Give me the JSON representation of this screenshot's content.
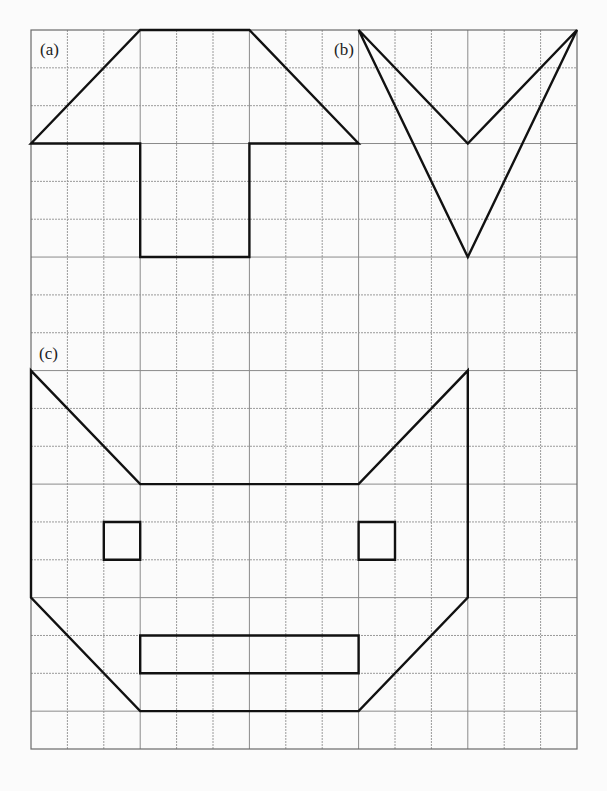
{
  "figure": {
    "grid": {
      "columns": 15,
      "rows": 19
    },
    "labels": [
      {
        "id": "a",
        "text": "(a)"
      },
      {
        "id": "b",
        "text": "(b)"
      },
      {
        "id": "c",
        "text": "(c)"
      }
    ],
    "shapes": [
      {
        "name": "figure-a-outline",
        "label": "a",
        "type": "polygon",
        "points_grid": [
          [
            0,
            3
          ],
          [
            3,
            0
          ],
          [
            6,
            0
          ],
          [
            9,
            3
          ],
          [
            6,
            3
          ],
          [
            6,
            6
          ],
          [
            3,
            6
          ],
          [
            3,
            3
          ]
        ]
      },
      {
        "name": "figure-b-outline",
        "label": "b",
        "type": "polygon",
        "points_grid": [
          [
            9,
            0
          ],
          [
            12,
            3
          ],
          [
            15,
            0
          ],
          [
            12,
            6
          ]
        ]
      },
      {
        "name": "figure-c-outline",
        "label": "c",
        "type": "polygon",
        "points_grid": [
          [
            0,
            9
          ],
          [
            3,
            12
          ],
          [
            9,
            12
          ],
          [
            12,
            9
          ],
          [
            12,
            15
          ],
          [
            9,
            18
          ],
          [
            3,
            18
          ],
          [
            0,
            15
          ]
        ]
      },
      {
        "name": "figure-c-left-eye",
        "label": "c",
        "type": "polygon",
        "points_grid": [
          [
            2,
            13
          ],
          [
            3,
            13
          ],
          [
            3,
            14
          ],
          [
            2,
            14
          ]
        ]
      },
      {
        "name": "figure-c-right-eye",
        "label": "c",
        "type": "polygon",
        "points_grid": [
          [
            9,
            13
          ],
          [
            10,
            13
          ],
          [
            10,
            14
          ],
          [
            9,
            14
          ]
        ]
      },
      {
        "name": "figure-c-mouth",
        "label": "c",
        "type": "polygon",
        "points_grid": [
          [
            3,
            16
          ],
          [
            9,
            16
          ],
          [
            9,
            17
          ],
          [
            3,
            17
          ]
        ]
      }
    ]
  }
}
